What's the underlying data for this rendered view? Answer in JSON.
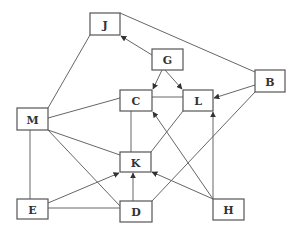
{
  "diagram": {
    "type": "directed-graph",
    "nodes": [
      {
        "id": "J",
        "label": "J",
        "x": 90,
        "y": 13,
        "w": 30,
        "h": 22
      },
      {
        "id": "G",
        "label": "G",
        "x": 152,
        "y": 49,
        "w": 31,
        "h": 21
      },
      {
        "id": "B",
        "label": "B",
        "x": 255,
        "y": 70,
        "w": 30,
        "h": 22
      },
      {
        "id": "C",
        "label": "C",
        "x": 120,
        "y": 90,
        "w": 32,
        "h": 21
      },
      {
        "id": "L",
        "label": "L",
        "x": 183,
        "y": 90,
        "w": 30,
        "h": 21
      },
      {
        "id": "M",
        "label": "M",
        "x": 17,
        "y": 108,
        "w": 31,
        "h": 22
      },
      {
        "id": "K",
        "label": "K",
        "x": 120,
        "y": 152,
        "w": 31,
        "h": 20
      },
      {
        "id": "E",
        "label": "E",
        "x": 17,
        "y": 199,
        "w": 31,
        "h": 20
      },
      {
        "id": "D",
        "label": "D",
        "x": 120,
        "y": 201,
        "w": 32,
        "h": 21
      },
      {
        "id": "H",
        "label": "H",
        "x": 213,
        "y": 199,
        "w": 31,
        "h": 21
      }
    ],
    "edges": [
      {
        "from": "M",
        "to": "J",
        "directed": false,
        "x1": 48,
        "y1": 108,
        "x2": 90,
        "y2": 35
      },
      {
        "from": "J",
        "to": "B",
        "directed": false,
        "x1": 120,
        "y1": 13,
        "x2": 255,
        "y2": 72
      },
      {
        "from": "G",
        "to": "J",
        "directed": true,
        "x1": 152,
        "y1": 55,
        "x2": 121,
        "y2": 36
      },
      {
        "from": "G",
        "to": "C",
        "directed": true,
        "x1": 162,
        "y1": 70,
        "x2": 153,
        "y2": 89
      },
      {
        "from": "G",
        "to": "L",
        "directed": true,
        "x1": 165,
        "y1": 70,
        "x2": 182,
        "y2": 89
      },
      {
        "from": "C",
        "to": "L",
        "directed": false,
        "x1": 152,
        "y1": 97,
        "x2": 183,
        "y2": 97
      },
      {
        "from": "B",
        "to": "L",
        "directed": true,
        "x1": 255,
        "y1": 85,
        "x2": 214,
        "y2": 98
      },
      {
        "from": "M",
        "to": "C",
        "directed": false,
        "x1": 48,
        "y1": 118,
        "x2": 120,
        "y2": 98
      },
      {
        "from": "C",
        "to": "K",
        "directed": false,
        "x1": 131,
        "y1": 111,
        "x2": 131,
        "y2": 152
      },
      {
        "from": "K",
        "to": "L",
        "directed": false,
        "x1": 151,
        "y1": 152,
        "x2": 183,
        "y2": 111
      },
      {
        "from": "H",
        "to": "C",
        "directed": true,
        "x1": 213,
        "y1": 199,
        "x2": 153,
        "y2": 112
      },
      {
        "from": "H",
        "to": "L",
        "directed": true,
        "x1": 213,
        "y1": 199,
        "x2": 213,
        "y2": 112
      },
      {
        "from": "H",
        "to": "K",
        "directed": true,
        "x1": 213,
        "y1": 199,
        "x2": 152,
        "y2": 172
      },
      {
        "from": "B",
        "to": "D",
        "directed": false,
        "x1": 255,
        "y1": 92,
        "x2": 152,
        "y2": 201
      },
      {
        "from": "M",
        "to": "K",
        "directed": false,
        "x1": 48,
        "y1": 130,
        "x2": 120,
        "y2": 155
      },
      {
        "from": "M",
        "to": "D",
        "directed": false,
        "x1": 48,
        "y1": 130,
        "x2": 120,
        "y2": 206
      },
      {
        "from": "M",
        "to": "E",
        "directed": false,
        "x1": 30,
        "y1": 130,
        "x2": 30,
        "y2": 199
      },
      {
        "from": "E",
        "to": "K",
        "directed": true,
        "x1": 48,
        "y1": 203,
        "x2": 119,
        "y2": 173
      },
      {
        "from": "E",
        "to": "D",
        "directed": false,
        "x1": 48,
        "y1": 208,
        "x2": 120,
        "y2": 208
      },
      {
        "from": "D",
        "to": "K",
        "directed": true,
        "x1": 133,
        "y1": 201,
        "x2": 133,
        "y2": 173
      }
    ]
  }
}
